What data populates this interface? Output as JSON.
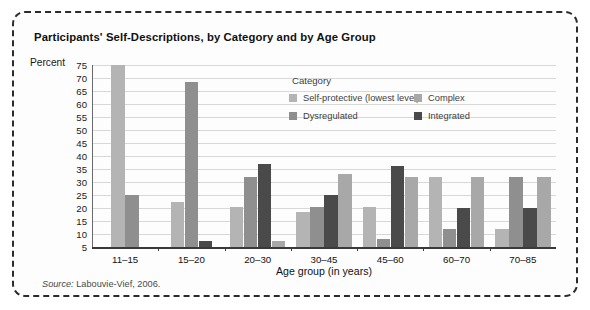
{
  "figure": {
    "title": "Participants' Self-Descriptions, by Category and by Age Group",
    "source_prefix": "Source:",
    "source_text": " Labouvie-Vief, 2006."
  },
  "legend": {
    "title": "Category",
    "entries": [
      {
        "label": "Self-protective (lowest level)",
        "color": "#b4b4b4"
      },
      {
        "label": "Complex",
        "color": "#a8a8a8"
      },
      {
        "label": "Dysregulated",
        "color": "#8f8f8f"
      },
      {
        "label": "Integrated",
        "color": "#4a4a4a"
      }
    ]
  },
  "chart_data": {
    "type": "bar",
    "title": "Participants' Self-Descriptions, by Category and by Age Group",
    "xlabel": "Age group (in years)",
    "ylabel": "Percent",
    "ylim": [
      5,
      75
    ],
    "ytick_step": 5,
    "yticks": [
      75,
      70,
      65,
      60,
      55,
      50,
      45,
      40,
      35,
      30,
      25,
      20,
      15,
      10,
      5
    ],
    "grid": true,
    "legend_position": "inside-upper-center",
    "categories": [
      "11–15",
      "15–20",
      "20–30",
      "30–45",
      "45–60",
      "60–70",
      "70–85"
    ],
    "series": [
      {
        "name": "Self-protective (lowest level)",
        "color": "#b4b4b4",
        "values": [
          75,
          22.5,
          20.5,
          18.5,
          20.5,
          32,
          12
        ]
      },
      {
        "name": "Dysregulated",
        "color": "#8f8f8f",
        "values": [
          25,
          68.5,
          32,
          20.5,
          8,
          12,
          32
        ]
      },
      {
        "name": "Integrated",
        "color": "#4a4a4a",
        "values": [
          null,
          7.5,
          37,
          25,
          36,
          20,
          20
        ]
      },
      {
        "name": "Complex",
        "color": "#a8a8a8",
        "values": [
          null,
          null,
          7.5,
          33,
          32,
          32,
          32
        ]
      }
    ]
  }
}
